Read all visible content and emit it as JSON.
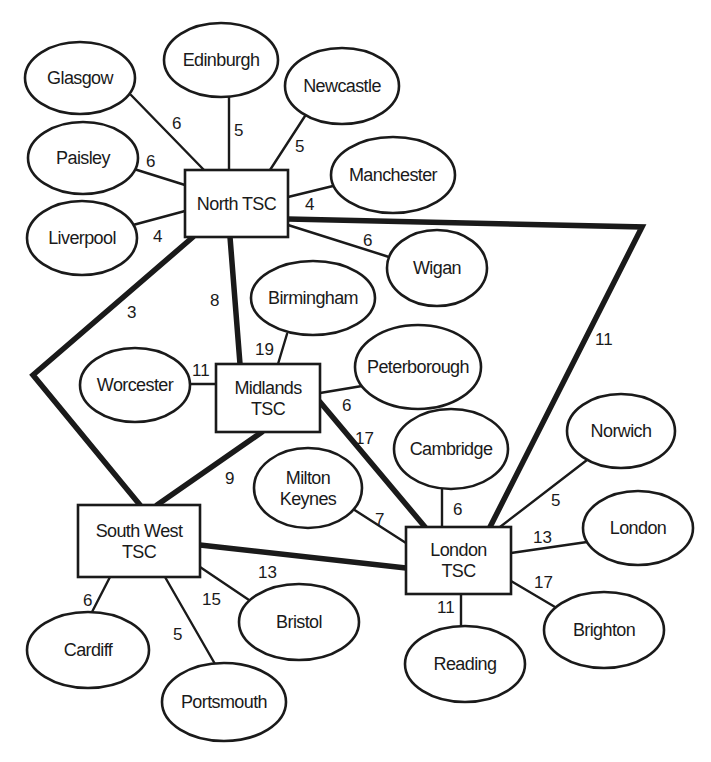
{
  "diagram": {
    "type": "network",
    "colors": {
      "line": "#1a1a1a",
      "background": "#ffffff"
    },
    "hubs": [
      {
        "id": "north",
        "lines": [
          "North TSC"
        ],
        "x": 185,
        "y": 170,
        "w": 103,
        "h": 67
      },
      {
        "id": "midlands",
        "lines": [
          "Midlands",
          "TSC"
        ],
        "x": 216,
        "y": 364,
        "w": 104,
        "h": 68
      },
      {
        "id": "southwest",
        "lines": [
          "South West",
          "TSC"
        ],
        "x": 78,
        "y": 505,
        "w": 122,
        "h": 72
      },
      {
        "id": "london_tsc",
        "lines": [
          "London",
          "TSC"
        ],
        "x": 406,
        "y": 527,
        "w": 105,
        "h": 67
      }
    ],
    "sites": [
      {
        "id": "glasgow",
        "lines": [
          "Glasgow"
        ],
        "cx": 80,
        "cy": 78,
        "rx": 55,
        "ry": 36
      },
      {
        "id": "edinburgh",
        "lines": [
          "Edinburgh"
        ],
        "cx": 221,
        "cy": 60,
        "rx": 57,
        "ry": 37
      },
      {
        "id": "newcastle",
        "lines": [
          "Newcastle"
        ],
        "cx": 342,
        "cy": 86,
        "rx": 57,
        "ry": 38
      },
      {
        "id": "paisley",
        "lines": [
          "Paisley"
        ],
        "cx": 83,
        "cy": 158,
        "rx": 55,
        "ry": 36
      },
      {
        "id": "manchester",
        "lines": [
          "Manchester"
        ],
        "cx": 393,
        "cy": 175,
        "rx": 62,
        "ry": 38
      },
      {
        "id": "liverpool",
        "lines": [
          "Liverpool"
        ],
        "cx": 82,
        "cy": 238,
        "rx": 55,
        "ry": 37
      },
      {
        "id": "wigan",
        "lines": [
          "Wigan"
        ],
        "cx": 437,
        "cy": 268,
        "rx": 50,
        "ry": 38
      },
      {
        "id": "birmingham",
        "lines": [
          "Birmingham"
        ],
        "cx": 313,
        "cy": 298,
        "rx": 62,
        "ry": 37
      },
      {
        "id": "worcester",
        "lines": [
          "Worcester"
        ],
        "cx": 135,
        "cy": 385,
        "rx": 55,
        "ry": 37
      },
      {
        "id": "peterborough",
        "lines": [
          "Peterborough"
        ],
        "cx": 418,
        "cy": 367,
        "rx": 63,
        "ry": 42
      },
      {
        "id": "cambridge",
        "lines": [
          "Cambridge"
        ],
        "cx": 451,
        "cy": 449,
        "rx": 57,
        "ry": 40
      },
      {
        "id": "norwich",
        "lines": [
          "Norwich"
        ],
        "cx": 621,
        "cy": 431,
        "rx": 54,
        "ry": 37
      },
      {
        "id": "milton_keynes",
        "lines": [
          "Milton",
          "Keynes"
        ],
        "cx": 308,
        "cy": 488,
        "rx": 54,
        "ry": 40
      },
      {
        "id": "london",
        "lines": [
          "London"
        ],
        "cx": 638,
        "cy": 528,
        "rx": 55,
        "ry": 37
      },
      {
        "id": "bristol",
        "lines": [
          "Bristol"
        ],
        "cx": 299,
        "cy": 622,
        "rx": 60,
        "ry": 38
      },
      {
        "id": "brighton",
        "lines": [
          "Brighton"
        ],
        "cx": 604,
        "cy": 630,
        "rx": 60,
        "ry": 38
      },
      {
        "id": "cardiff",
        "lines": [
          "Cardiff"
        ],
        "cx": 88,
        "cy": 650,
        "rx": 61,
        "ry": 38
      },
      {
        "id": "reading",
        "lines": [
          "Reading"
        ],
        "cx": 465,
        "cy": 664,
        "rx": 60,
        "ry": 38
      },
      {
        "id": "portsmouth",
        "lines": [
          "Portsmouth"
        ],
        "cx": 224,
        "cy": 702,
        "rx": 62,
        "ry": 39
      }
    ],
    "trunk_links": [
      {
        "from": "North TSC",
        "to": "Midlands TSC",
        "weight": "8",
        "points": [
          [
            230,
            237
          ],
          [
            240,
            364
          ]
        ],
        "label_at": [
          210,
          306
        ]
      },
      {
        "from": "North TSC",
        "to": "South West TSC",
        "weight": "3",
        "points": [
          [
            193,
            237
          ],
          [
            33,
            375
          ],
          [
            140,
            505
          ]
        ],
        "label_at": [
          127,
          318
        ]
      },
      {
        "from": "North TSC",
        "to": "London TSC",
        "weight": "11",
        "points": [
          [
            288,
            219
          ],
          [
            642,
            227
          ],
          [
            490,
            527
          ]
        ],
        "label_at": [
          595,
          345
        ]
      },
      {
        "from": "Midlands TSC",
        "to": "South West TSC",
        "weight": "9",
        "points": [
          [
            262,
            432
          ],
          [
            157,
            505
          ]
        ],
        "label_at": [
          225,
          484
        ]
      },
      {
        "from": "Midlands TSC",
        "to": "London TSC",
        "weight": "17",
        "points": [
          [
            320,
            402
          ],
          [
            425,
            527
          ]
        ],
        "label_at": [
          355,
          444
        ]
      },
      {
        "from": "South West TSC",
        "to": "London TSC",
        "weight": "13",
        "points": [
          [
            200,
            545
          ],
          [
            406,
            568
          ]
        ],
        "label_at": [
          258,
          578
        ]
      }
    ],
    "access_links": [
      {
        "from": "North TSC",
        "to": "Glasgow",
        "weight": "6",
        "points": [
          [
            131,
            95
          ],
          [
            204,
            170
          ]
        ],
        "label_at": [
          172,
          129
        ]
      },
      {
        "from": "North TSC",
        "to": "Edinburgh",
        "weight": "5",
        "points": [
          [
            229,
            97
          ],
          [
            229,
            170
          ]
        ],
        "label_at": [
          234,
          136
        ]
      },
      {
        "from": "North TSC",
        "to": "Newcastle",
        "weight": "5",
        "points": [
          [
            305,
            116
          ],
          [
            270,
            170
          ]
        ],
        "label_at": [
          295,
          152
        ]
      },
      {
        "from": "North TSC",
        "to": "Paisley",
        "weight": "6",
        "points": [
          [
            134,
            169
          ],
          [
            185,
            185
          ]
        ],
        "label_at": [
          146,
          167
        ]
      },
      {
        "from": "North TSC",
        "to": "Manchester",
        "weight": "4",
        "points": [
          [
            333,
            186
          ],
          [
            288,
            197
          ]
        ],
        "label_at": [
          305,
          210
        ]
      },
      {
        "from": "North TSC",
        "to": "Liverpool",
        "weight": "4",
        "points": [
          [
            133,
            225
          ],
          [
            185,
            211
          ]
        ],
        "label_at": [
          153,
          242
        ]
      },
      {
        "from": "North TSC",
        "to": "Wigan",
        "weight": "6",
        "points": [
          [
            288,
            225
          ],
          [
            389,
            257
          ]
        ],
        "label_at": [
          363,
          246
        ]
      },
      {
        "from": "Midlands TSC",
        "to": "Birmingham",
        "weight": "19",
        "points": [
          [
            287,
            334
          ],
          [
            278,
            364
          ]
        ],
        "label_at": [
          255,
          355
        ]
      },
      {
        "from": "Midlands TSC",
        "to": "Worcester",
        "weight": "11",
        "points": [
          [
            190,
            384
          ],
          [
            216,
            384
          ]
        ],
        "label_at": [
          192,
          376
        ]
      },
      {
        "from": "Midlands TSC",
        "to": "Peterborough",
        "weight": "6",
        "points": [
          [
            320,
            393
          ],
          [
            362,
            386
          ]
        ],
        "label_at": [
          342,
          411
        ]
      },
      {
        "from": "London TSC",
        "to": "Cambridge",
        "weight": "6",
        "points": [
          [
            442,
            489
          ],
          [
            442,
            527
          ]
        ],
        "label_at": [
          453,
          515
        ]
      },
      {
        "from": "London TSC",
        "to": "Norwich",
        "weight": "5",
        "points": [
          [
            587,
            460
          ],
          [
            500,
            527
          ]
        ],
        "label_at": [
          551,
          506
        ]
      },
      {
        "from": "London TSC",
        "to": "Milton Keynes",
        "weight": "7",
        "points": [
          [
            353,
            509
          ],
          [
            406,
            543
          ]
        ],
        "label_at": [
          375,
          525
        ]
      },
      {
        "from": "London TSC",
        "to": "London",
        "weight": "13",
        "points": [
          [
            511,
            553
          ],
          [
            587,
            542
          ]
        ],
        "label_at": [
          533,
          543
        ]
      },
      {
        "from": "London TSC",
        "to": "Brighton",
        "weight": "17",
        "points": [
          [
            511,
            581
          ],
          [
            555,
            607
          ]
        ],
        "label_at": [
          534,
          588
        ]
      },
      {
        "from": "London TSC",
        "to": "Reading",
        "weight": "11",
        "points": [
          [
            461,
            594
          ],
          [
            461,
            626
          ]
        ],
        "label_at": [
          437,
          613
        ]
      },
      {
        "from": "South West TSC",
        "to": "Cardiff",
        "weight": "6",
        "points": [
          [
            110,
            577
          ],
          [
            92,
            612
          ]
        ],
        "label_at": [
          83,
          606
        ]
      },
      {
        "from": "South West TSC",
        "to": "Portsmouth",
        "weight": "5",
        "points": [
          [
            165,
            577
          ],
          [
            215,
            664
          ]
        ],
        "label_at": [
          173,
          640
        ]
      },
      {
        "from": "South West TSC",
        "to": "Bristol",
        "weight": "15",
        "points": [
          [
            200,
            567
          ],
          [
            249,
            600
          ]
        ],
        "label_at": [
          202,
          605
        ]
      }
    ]
  }
}
